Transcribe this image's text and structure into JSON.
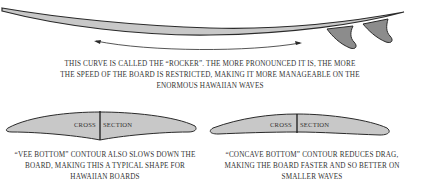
{
  "diagram": {
    "rocker": {
      "caption": "THIS CURVE IS CALLED THE “ROCKER”. THE MORE PRONOUNCED IT IS, THE MORE THE SPEED OF THE BOARD IS RESTRICTED, MAKING IT MORE MANAGEABLE ON THE ENORMOUS HAWAIIAN WAVES"
    },
    "vee_bottom": {
      "label_left": "CROSS",
      "label_right": "SECTION",
      "caption": "“VEE BOTTOM” CONTOUR ALSO SLOWS DOWN THE BOARD, MAKING THIS A TYPICAL SHAPE FOR HAWAIIAN BOARDS"
    },
    "concave_bottom": {
      "label_left": "CROSS",
      "label_right": "SECTION",
      "caption": "“CONCAVE BOTTOM” CONTOUR REDUCES DRAG, MAKING THE BOARD FASTER AND SO BETTER ON SMALLER WAVES"
    },
    "colors": {
      "board_fill": "#c8c8c8",
      "fin_fill": "#8c8c8c",
      "outline": "#2a2a2a"
    }
  }
}
